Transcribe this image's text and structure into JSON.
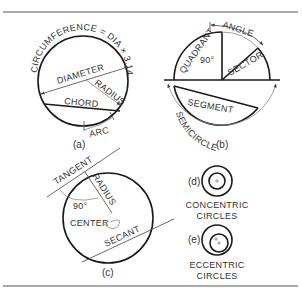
{
  "figure": {
    "panels": [
      {
        "id": "a",
        "caption": "(a)",
        "labels": {
          "circumference": "CIRCUMFERENCE = DIA × 3.1416",
          "diameter": "DIAMETER",
          "radius": "RADIUS",
          "chord": "CHORD",
          "arc": "ARC"
        }
      },
      {
        "id": "b",
        "caption": "(b)",
        "labels": {
          "angle": "ANGLE",
          "quadrant": "QUADRANT",
          "right_angle": "90°",
          "sector": "SECTOR",
          "segment": "SEGMENT",
          "semicircle": "SEMICIRCLE"
        }
      },
      {
        "id": "c",
        "caption": "(c)",
        "labels": {
          "tangent": "TANGENT",
          "radius": "RADIUS",
          "right_angle": "90°",
          "center": "CENTER",
          "secant": "SECANT"
        }
      },
      {
        "id": "d",
        "caption": "(d)",
        "labels": {
          "line1": "CONCENTRIC",
          "line2": "CIRCLES"
        }
      },
      {
        "id": "e",
        "caption": "(e)",
        "labels": {
          "line1": "ECCENTRIC",
          "line2": "CIRCLES"
        }
      }
    ]
  }
}
